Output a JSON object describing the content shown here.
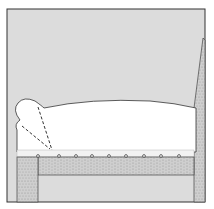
{
  "figure": {
    "colors": {
      "background": "#ffffff",
      "panel": "#dcdcdc",
      "frame_line": "#333333",
      "cushion": "#ffffff",
      "wood": "#c9c9c9",
      "wood_grain": "#8a8a8a",
      "tack": "#555555"
    },
    "tacks_x": [
      38,
      59,
      76,
      92,
      109,
      126,
      144,
      161,
      179
    ]
  }
}
